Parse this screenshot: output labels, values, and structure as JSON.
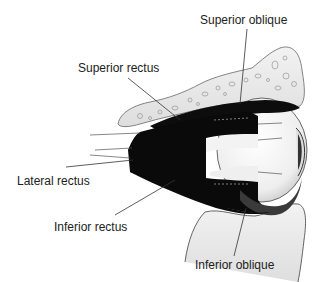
{
  "diagram": {
    "labels": {
      "superior_oblique": "Superior oblique",
      "superior_rectus": "Superior rectus",
      "lateral_rectus": "Lateral rectus",
      "inferior_rectus": "Inferior rectus",
      "inferior_oblique": "Inferior oblique"
    },
    "colors": {
      "muscle": "#0a0a0a",
      "bone_fill": "#ececec",
      "bone_stroke": "#555555",
      "eyeball": "#f4f4f4",
      "leader_line": "#333333",
      "text": "#222222"
    }
  }
}
